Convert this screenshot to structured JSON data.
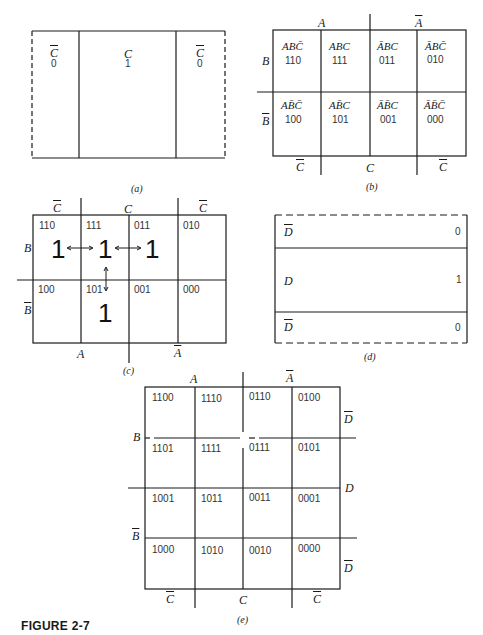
{
  "figure_label": "FIGURE 2-7",
  "panel_a": {
    "caption": "(a)",
    "cells": [
      {
        "var": "C",
        "negated": true,
        "value": "0"
      },
      {
        "var": "C",
        "negated": false,
        "value": "1"
      },
      {
        "var": "C",
        "negated": true,
        "value": "0"
      }
    ]
  },
  "panel_b": {
    "caption": "(b)",
    "top_labels": [
      {
        "var": "A",
        "negated": false
      },
      {
        "var": "A",
        "negated": true
      }
    ],
    "side_labels": [
      {
        "var": "B",
        "negated": false
      },
      {
        "var": "B",
        "negated": true
      }
    ],
    "bottom_labels": [
      {
        "var": "C",
        "negated": true
      },
      {
        "var": "C",
        "negated": false
      },
      {
        "var": "C",
        "negated": true
      }
    ],
    "rows": [
      [
        {
          "term": "ABC̄",
          "code": "110"
        },
        {
          "term": "ABC",
          "code": "111"
        },
        {
          "term": "ĀBC",
          "code": "011"
        },
        {
          "term": "ĀBC̄",
          "code": "010"
        }
      ],
      [
        {
          "term": "AB̄C̄",
          "code": "100"
        },
        {
          "term": "AB̄C",
          "code": "101"
        },
        {
          "term": "ĀB̄C",
          "code": "001"
        },
        {
          "term": "ĀB̄C̄",
          "code": "000"
        }
      ]
    ]
  },
  "panel_c": {
    "caption": "(c)",
    "top_labels": [
      {
        "var": "C",
        "negated": true
      },
      {
        "var": "C",
        "negated": false
      },
      {
        "var": "C",
        "negated": true
      }
    ],
    "side_labels": [
      {
        "var": "B",
        "negated": false
      },
      {
        "var": "B",
        "negated": true
      }
    ],
    "bottom_labels": [
      {
        "var": "A",
        "negated": false
      },
      {
        "var": "A",
        "negated": true
      }
    ],
    "rows": [
      [
        {
          "code": "110",
          "mark": "1"
        },
        {
          "code": "111",
          "mark": "1"
        },
        {
          "code": "011",
          "mark": "1"
        },
        {
          "code": "010",
          "mark": ""
        }
      ],
      [
        {
          "code": "100",
          "mark": ""
        },
        {
          "code": "101",
          "mark": "1"
        },
        {
          "code": "001",
          "mark": ""
        },
        {
          "code": "000",
          "mark": ""
        }
      ]
    ],
    "arrows": [
      "110<->111",
      "111<->011",
      "111<->101"
    ]
  },
  "panel_d": {
    "caption": "(d)",
    "rows": [
      {
        "var": "D",
        "negated": true,
        "value": "0"
      },
      {
        "var": "D",
        "negated": false,
        "value": "1"
      },
      {
        "var": "D",
        "negated": true,
        "value": "0"
      }
    ]
  },
  "panel_e": {
    "caption": "(e)",
    "top_labels": [
      {
        "var": "A",
        "negated": false
      },
      {
        "var": "A",
        "negated": true
      }
    ],
    "left_labels": [
      {
        "var": "B",
        "negated": false
      },
      {
        "var": "B",
        "negated": true
      }
    ],
    "right_labels": [
      {
        "var": "D",
        "negated": true
      },
      {
        "var": "D",
        "negated": false
      },
      {
        "var": "D",
        "negated": true
      }
    ],
    "bottom_labels": [
      {
        "var": "C",
        "negated": true
      },
      {
        "var": "C",
        "negated": false
      },
      {
        "var": "C",
        "negated": true
      }
    ],
    "rows": [
      [
        "1100",
        "1110",
        "0110",
        "0100"
      ],
      [
        "1101",
        "1111",
        "0111",
        "0101"
      ],
      [
        "1001",
        "1011",
        "0011",
        "0001"
      ],
      [
        "1000",
        "1010",
        "0010",
        "0000"
      ]
    ]
  }
}
